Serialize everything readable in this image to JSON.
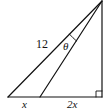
{
  "diagram": {
    "type": "geometry-right-triangle",
    "colors": {
      "stroke": "#111111",
      "background": "#ffffff"
    },
    "labels": {
      "hypotenuse": "12",
      "angle": "θ",
      "left_segment": "x",
      "right_segment": "2x"
    },
    "features": [
      "right-angle-marker",
      "angle-arc-theta"
    ]
  }
}
